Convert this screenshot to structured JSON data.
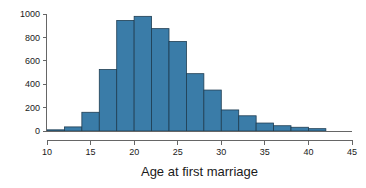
{
  "chart_data": {
    "type": "bar",
    "title": "",
    "subtitle": "",
    "xlabel": "Age at first marriage",
    "ylabel": "",
    "xlim": [
      10,
      45
    ],
    "ylim": [
      0,
      1000
    ],
    "grid": false,
    "legend": null,
    "bin_width": 2,
    "bar_color": "#3a7ca8",
    "bar_edge_color": "#1f3d52",
    "axis_color": "#666666",
    "text_color": "#1a1a1a",
    "background_color": "#ffffff",
    "xticks": [
      10,
      15,
      20,
      25,
      30,
      35,
      40,
      45
    ],
    "xtick_labels": [
      "10",
      "15",
      "20",
      "25",
      "30",
      "35",
      "40",
      "45"
    ],
    "xminor_ticks": [
      10,
      15,
      20,
      25,
      30,
      35,
      40,
      45
    ],
    "yticks": [
      0,
      200,
      400,
      600,
      800,
      1000
    ],
    "ytick_labels": [
      "0",
      "200",
      "400",
      "600",
      "800",
      "1000"
    ],
    "bins": [
      {
        "x0": 10,
        "x1": 12,
        "value": 10
      },
      {
        "x0": 12,
        "x1": 14,
        "value": 35
      },
      {
        "x0": 14,
        "x1": 16,
        "value": 160
      },
      {
        "x0": 16,
        "x1": 18,
        "value": 525
      },
      {
        "x0": 18,
        "x1": 20,
        "value": 945
      },
      {
        "x0": 20,
        "x1": 22,
        "value": 980
      },
      {
        "x0": 22,
        "x1": 24,
        "value": 875
      },
      {
        "x0": 24,
        "x1": 26,
        "value": 765
      },
      {
        "x0": 26,
        "x1": 28,
        "value": 490
      },
      {
        "x0": 28,
        "x1": 30,
        "value": 350
      },
      {
        "x0": 30,
        "x1": 32,
        "value": 180
      },
      {
        "x0": 32,
        "x1": 34,
        "value": 130
      },
      {
        "x0": 34,
        "x1": 36,
        "value": 68
      },
      {
        "x0": 36,
        "x1": 38,
        "value": 45
      },
      {
        "x0": 38,
        "x1": 40,
        "value": 32
      },
      {
        "x0": 40,
        "x1": 42,
        "value": 20
      }
    ]
  }
}
